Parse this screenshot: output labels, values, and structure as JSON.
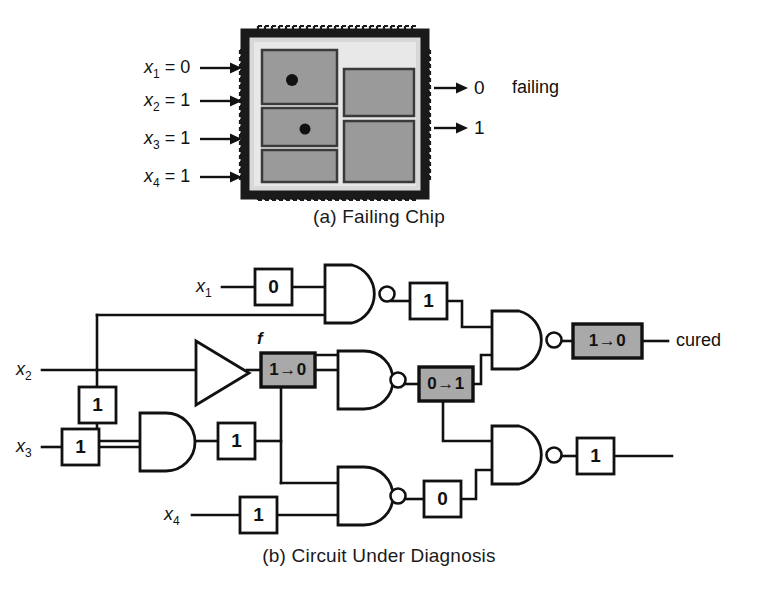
{
  "figure": {
    "panels": [
      {
        "id": "a",
        "caption": "(a) Failing Chip",
        "chip": {
          "inputs": [
            {
              "name": "x",
              "subscript": "1",
              "eq": "=",
              "value": "0"
            },
            {
              "name": "x",
              "subscript": "2",
              "eq": "=",
              "value": "1"
            },
            {
              "name": "x",
              "subscript": "3",
              "eq": "=",
              "value": "1"
            },
            {
              "name": "x",
              "subscript": "4",
              "eq": "=",
              "value": "1"
            }
          ],
          "outputs": [
            {
              "value": "0"
            },
            {
              "value": "1"
            }
          ],
          "status_note": "failing",
          "blocks": [
            {
              "id": "block-top-left",
              "has_fault_dot": true
            },
            {
              "id": "block-mid-left",
              "has_fault_dot": true
            },
            {
              "id": "block-bottom-left",
              "has_fault_dot": false
            },
            {
              "id": "block-top-right",
              "has_fault_dot": false
            },
            {
              "id": "block-bottom-right",
              "has_fault_dot": false
            }
          ],
          "colors": {
            "package_border": "#1a1a1a",
            "package_fill": "#d8d8d8",
            "die_fill": "#e8e8e8",
            "block_fill": "#9a9a9a",
            "fault_dot": "#111111"
          }
        }
      },
      {
        "id": "b",
        "caption": "(b) Circuit Under Diagnosis",
        "circuit": {
          "inputs": [
            {
              "name": "x",
              "subscript": "1"
            },
            {
              "name": "x",
              "subscript": "2"
            },
            {
              "name": "x",
              "subscript": "3"
            },
            {
              "name": "x",
              "subscript": "4"
            }
          ],
          "signal_label": "f",
          "output_note": "cured",
          "value_boxes": [
            {
              "id": "vb-x1",
              "text": "0",
              "highlighted": false
            },
            {
              "id": "vb-x2",
              "text": "1",
              "highlighted": false
            },
            {
              "id": "vb-x3",
              "text": "1",
              "highlighted": false
            },
            {
              "id": "vb-x4",
              "text": "1",
              "highlighted": false
            },
            {
              "id": "vb-nand1-out",
              "text": "1",
              "highlighted": false
            },
            {
              "id": "vb-and-out",
              "text": "1",
              "highlighted": false
            },
            {
              "id": "vb-nand4-out",
              "text": "0",
              "highlighted": false
            },
            {
              "id": "vb-nand5-out",
              "text": "1",
              "highlighted": false
            },
            {
              "id": "vb-buf-out",
              "text": "1→0",
              "highlighted": true
            },
            {
              "id": "vb-nand2-out",
              "text": "0→1",
              "highlighted": true
            },
            {
              "id": "vb-final-out",
              "text": "1→0",
              "highlighted": true
            }
          ],
          "gates": [
            {
              "id": "gate-nand-1",
              "type": "NAND"
            },
            {
              "id": "gate-buffer",
              "type": "BUFFER"
            },
            {
              "id": "gate-nand-2",
              "type": "NAND"
            },
            {
              "id": "gate-and-1",
              "type": "AND"
            },
            {
              "id": "gate-nand-3",
              "type": "NAND"
            },
            {
              "id": "gate-nand-4",
              "type": "NAND"
            },
            {
              "id": "gate-nand-5",
              "type": "NAND"
            }
          ],
          "colors": {
            "wire": "#111111",
            "gate_fill": "#ffffff",
            "box_fill": "#ffffff",
            "highlight_fill": "#a9a9a9"
          }
        }
      }
    ]
  }
}
